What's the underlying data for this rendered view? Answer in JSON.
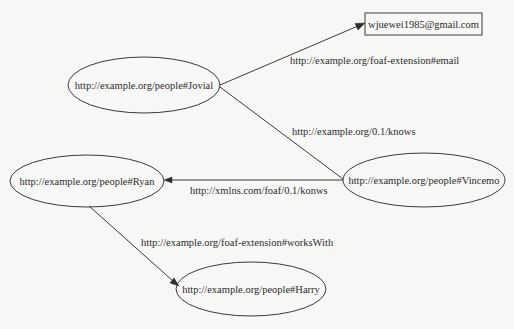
{
  "diagram": {
    "type": "rdf-graph",
    "nodes": [
      {
        "id": "jovial",
        "shape": "ellipse",
        "label": "http://example.org/people#Jovial"
      },
      {
        "id": "email",
        "shape": "box",
        "label": "wjuewei1985@gmail.com"
      },
      {
        "id": "vincemo",
        "shape": "ellipse",
        "label": "http://example.org/people#Vincemo"
      },
      {
        "id": "ryan",
        "shape": "ellipse",
        "label": "http://example.org/people#Ryan"
      },
      {
        "id": "harry",
        "shape": "ellipse",
        "label": "http://example.org/people#Harry"
      }
    ],
    "edges": [
      {
        "id": "jovial-email",
        "from": "jovial",
        "to": "email",
        "label": "http://example.org/foaf-extension#email",
        "arrow": true
      },
      {
        "id": "jovial-vincemo",
        "from": "jovial",
        "to": "vincemo",
        "label": "http://example.org/0.1/knows",
        "arrow": false
      },
      {
        "id": "vincemo-ryan",
        "from": "vincemo",
        "to": "ryan",
        "label": "http://xmlns.com/foaf/0.1/konws",
        "arrow": true
      },
      {
        "id": "ryan-harry",
        "from": "ryan",
        "to": "harry",
        "label": "http://example.org/foaf-extension#worksWith",
        "arrow": true
      }
    ]
  }
}
